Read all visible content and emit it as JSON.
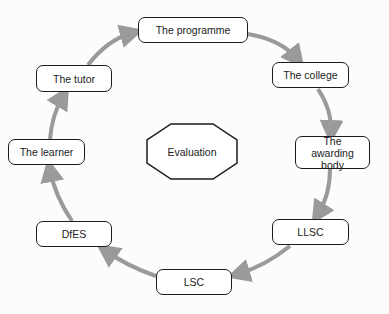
{
  "diagram": {
    "type": "cycle",
    "center": {
      "label": "Evaluation",
      "shape": "octagon"
    },
    "nodes": [
      {
        "id": "programme",
        "label": "The programme"
      },
      {
        "id": "college",
        "label": "The college"
      },
      {
        "id": "awarding",
        "label": "The awarding body"
      },
      {
        "id": "llsc",
        "label": "LLSC"
      },
      {
        "id": "lsc",
        "label": "LSC"
      },
      {
        "id": "dfes",
        "label": "DfES"
      },
      {
        "id": "learner",
        "label": "The learner"
      },
      {
        "id": "tutor",
        "label": "The tutor"
      }
    ],
    "edges": [
      [
        "programme",
        "college"
      ],
      [
        "college",
        "awarding"
      ],
      [
        "awarding",
        "llsc"
      ],
      [
        "llsc",
        "lsc"
      ],
      [
        "lsc",
        "dfes"
      ],
      [
        "dfes",
        "learner"
      ],
      [
        "learner",
        "tutor"
      ],
      [
        "tutor",
        "programme"
      ]
    ],
    "colors": {
      "arrow": "#9a9a9a",
      "border": "#1c1c1c",
      "background": "#ffffff"
    }
  }
}
